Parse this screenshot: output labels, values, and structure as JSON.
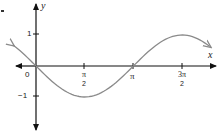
{
  "chart_data": {
    "type": "line",
    "title": "",
    "function": "y = -sin(x)",
    "xlabel": "x",
    "ylabel": "y",
    "x_ticks": [
      {
        "value": 1.5708,
        "label_num": "π",
        "label_den": "2"
      },
      {
        "value": 3.1416,
        "label": "π"
      },
      {
        "value": 4.7124,
        "label_num": "3π",
        "label_den": "2"
      }
    ],
    "y_ticks": [
      {
        "value": 1,
        "label": "1"
      },
      {
        "value": -1,
        "label": "−1"
      }
    ],
    "origin_label": "0",
    "xlim": [
      -1.1,
      6.0
    ],
    "ylim": [
      -1.7,
      1.7
    ],
    "grid": false,
    "legend": null,
    "series": [
      {
        "name": "y = -sin(x)",
        "color": "#8a8a8a",
        "x": [
          -0.75,
          0,
          0.785,
          1.5708,
          2.356,
          3.1416,
          3.927,
          4.7124,
          5.3,
          5.6
        ],
        "y": [
          0.68,
          0,
          -0.707,
          -1,
          -0.707,
          0,
          0.707,
          1,
          0.83,
          0.63
        ]
      }
    ],
    "axis_color": "#111111"
  },
  "labels": {
    "x_axis": "x",
    "y_axis": "y",
    "origin": "0",
    "y_pos_one": "1",
    "y_neg_one": "−1",
    "pi_half_num": "π",
    "pi_half_den": "2",
    "pi": "π",
    "three_pi_half_num": "3π",
    "three_pi_half_den": "2"
  }
}
